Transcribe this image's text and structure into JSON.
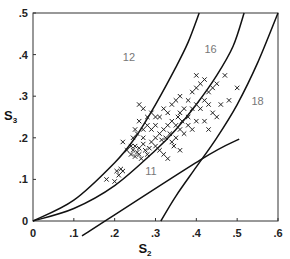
{
  "chart_data": {
    "type": "scatter",
    "title": "",
    "xlabel": "S2",
    "ylabel": "S3",
    "xlim": [
      0,
      0.6
    ],
    "ylim": [
      0,
      0.5
    ],
    "grid": false,
    "legend": null,
    "x_ticks": [
      ".1",
      ".2",
      ".3",
      ".4",
      ".5",
      ".6"
    ],
    "x_tick_values": [
      0.1,
      0.2,
      0.3,
      0.4,
      0.5,
      0.6
    ],
    "x_origin_label": "0",
    "y_ticks": [
      ".1",
      ".2",
      ".3",
      ".4",
      ".5"
    ],
    "y_tick_values": [
      0.1,
      0.2,
      0.3,
      0.4,
      0.5
    ],
    "y_origin_label": "0",
    "marker": "x",
    "curves": [
      {
        "name": "12",
        "label_pos": [
          0.22,
          0.385
        ],
        "points": [
          [
            0,
            0
          ],
          [
            0.1,
            0.05
          ],
          [
            0.2,
            0.14
          ],
          [
            0.25,
            0.2
          ],
          [
            0.3,
            0.28
          ],
          [
            0.35,
            0.37
          ],
          [
            0.38,
            0.43
          ],
          [
            0.407,
            0.5
          ]
        ]
      },
      {
        "name": "16",
        "label_pos": [
          0.42,
          0.405
        ],
        "points": [
          [
            0,
            0
          ],
          [
            0.1,
            0.03
          ],
          [
            0.2,
            0.085
          ],
          [
            0.3,
            0.17
          ],
          [
            0.35,
            0.22
          ],
          [
            0.4,
            0.28
          ],
          [
            0.45,
            0.35
          ],
          [
            0.49,
            0.42
          ],
          [
            0.517,
            0.5
          ]
        ]
      },
      {
        "name": "18",
        "label_pos": [
          0.535,
          0.28
        ],
        "points": [
          [
            0.313,
            0
          ],
          [
            0.35,
            0.06
          ],
          [
            0.4,
            0.13
          ],
          [
            0.45,
            0.2
          ],
          [
            0.5,
            0.28
          ],
          [
            0.55,
            0.38
          ],
          [
            0.6,
            0.5
          ]
        ]
      },
      {
        "name": "11",
        "label_pos": [
          0.275,
          0.11
        ],
        "points": [
          [
            0.12,
            -0.036
          ],
          [
            0.41,
            0.147
          ],
          [
            0.505,
            0.197
          ]
        ]
      }
    ],
    "series": [
      {
        "name": "observations",
        "points": [
          [
            0.18,
            0.1
          ],
          [
            0.2,
            0.095
          ],
          [
            0.205,
            0.12
          ],
          [
            0.21,
            0.11
          ],
          [
            0.215,
            0.125
          ],
          [
            0.22,
            0.12
          ],
          [
            0.22,
            0.19
          ],
          [
            0.24,
            0.16
          ],
          [
            0.245,
            0.17
          ],
          [
            0.25,
            0.155
          ],
          [
            0.25,
            0.18
          ],
          [
            0.255,
            0.165
          ],
          [
            0.26,
            0.16
          ],
          [
            0.26,
            0.175
          ],
          [
            0.265,
            0.15
          ],
          [
            0.27,
            0.185
          ],
          [
            0.27,
            0.2
          ],
          [
            0.275,
            0.17
          ],
          [
            0.28,
            0.16
          ],
          [
            0.285,
            0.175
          ],
          [
            0.29,
            0.19
          ],
          [
            0.27,
            0.22
          ],
          [
            0.28,
            0.23
          ],
          [
            0.26,
            0.24
          ],
          [
            0.255,
            0.21
          ],
          [
            0.245,
            0.2
          ],
          [
            0.3,
            0.2
          ],
          [
            0.3,
            0.18
          ],
          [
            0.31,
            0.21
          ],
          [
            0.315,
            0.195
          ],
          [
            0.32,
            0.22
          ],
          [
            0.325,
            0.2
          ],
          [
            0.33,
            0.23
          ],
          [
            0.335,
            0.21
          ],
          [
            0.34,
            0.24
          ],
          [
            0.35,
            0.23
          ],
          [
            0.355,
            0.25
          ],
          [
            0.36,
            0.22
          ],
          [
            0.365,
            0.24
          ],
          [
            0.37,
            0.21
          ],
          [
            0.31,
            0.17
          ],
          [
            0.32,
            0.16
          ],
          [
            0.33,
            0.15
          ],
          [
            0.345,
            0.18
          ],
          [
            0.36,
            0.17
          ],
          [
            0.27,
            0.27
          ],
          [
            0.29,
            0.26
          ],
          [
            0.3,
            0.25
          ],
          [
            0.26,
            0.28
          ],
          [
            0.33,
            0.26
          ],
          [
            0.34,
            0.28
          ],
          [
            0.35,
            0.29
          ],
          [
            0.36,
            0.3
          ],
          [
            0.38,
            0.29
          ],
          [
            0.39,
            0.31
          ],
          [
            0.4,
            0.32
          ],
          [
            0.41,
            0.33
          ],
          [
            0.42,
            0.34
          ],
          [
            0.4,
            0.35
          ],
          [
            0.43,
            0.31
          ],
          [
            0.44,
            0.32
          ],
          [
            0.45,
            0.33
          ],
          [
            0.38,
            0.25
          ],
          [
            0.39,
            0.27
          ],
          [
            0.4,
            0.28
          ],
          [
            0.41,
            0.27
          ],
          [
            0.42,
            0.29
          ],
          [
            0.43,
            0.28
          ],
          [
            0.44,
            0.26
          ],
          [
            0.45,
            0.25
          ],
          [
            0.38,
            0.23
          ],
          [
            0.39,
            0.22
          ],
          [
            0.4,
            0.24
          ],
          [
            0.42,
            0.24
          ],
          [
            0.43,
            0.22
          ],
          [
            0.37,
            0.27
          ],
          [
            0.36,
            0.26
          ],
          [
            0.47,
            0.35
          ],
          [
            0.46,
            0.28
          ],
          [
            0.48,
            0.29
          ],
          [
            0.5,
            0.32
          ],
          [
            0.35,
            0.2
          ],
          [
            0.34,
            0.19
          ],
          [
            0.29,
            0.22
          ],
          [
            0.28,
            0.25
          ],
          [
            0.25,
            0.22
          ],
          [
            0.24,
            0.18
          ],
          [
            0.23,
            0.17
          ],
          [
            0.3,
            0.23
          ],
          [
            0.31,
            0.25
          ],
          [
            0.32,
            0.27
          ]
        ]
      }
    ]
  }
}
